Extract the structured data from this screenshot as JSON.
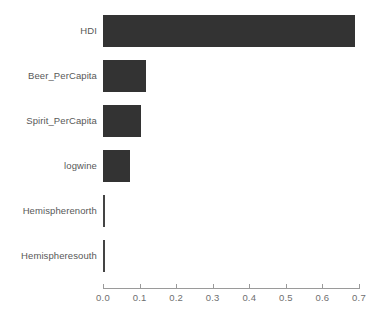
{
  "chart_data": {
    "type": "bar",
    "orientation": "horizontal",
    "title": "",
    "subtitle": "",
    "xlabel": "",
    "ylabel": "",
    "categories": [
      "HDI",
      "Beer_PerCapita",
      "Spirit_PerCapita",
      "logwine",
      "Hemispherenorth",
      "Hemispheresouth"
    ],
    "values": [
      0.69,
      0.117,
      0.104,
      0.074,
      0.005,
      0.005
    ],
    "series": [
      {
        "name": "importance",
        "values": [
          0.69,
          0.117,
          0.104,
          0.074,
          0.005,
          0.005
        ]
      }
    ],
    "xlim": [
      0.0,
      0.7
    ],
    "xticks": [
      0.0,
      0.1,
      0.2,
      0.3,
      0.4,
      0.5,
      0.6,
      0.7
    ],
    "xtick_labels": [
      "0.0",
      "0.1",
      "0.2",
      "0.3",
      "0.4",
      "0.5",
      "0.6",
      "0.7"
    ],
    "grid": false,
    "legend": null,
    "bar_color": "#333333",
    "axis_color": "#9a9a9a",
    "label_color": "#585858",
    "tick_label_color": "#6f6f6f",
    "background": "#ffffff",
    "annotations": []
  }
}
